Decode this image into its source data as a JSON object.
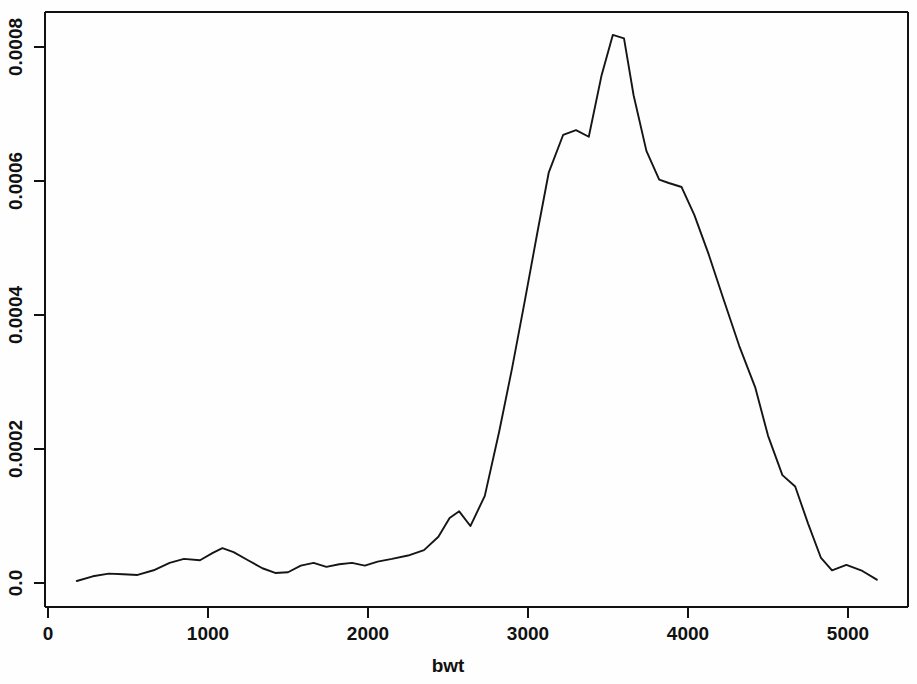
{
  "chart_data": {
    "type": "line",
    "title": "",
    "subtitle": "",
    "xlabel": "bwt",
    "ylabel": "",
    "xlim": [
      150,
      5220
    ],
    "ylim": [
      0.0,
      0.00085
    ],
    "grid": false,
    "legend": null,
    "line_color": "#151515",
    "background_color": "#ffffff",
    "axis_color": "#111111",
    "x_ticks": [
      0,
      1000,
      2000,
      3000,
      4000,
      5000
    ],
    "x_tick_labels": [
      "0",
      "1000",
      "2000",
      "3000",
      "4000",
      "5000"
    ],
    "y_ticks": [
      0.0,
      0.0002,
      0.0004,
      0.0006,
      0.0008
    ],
    "y_tick_labels": [
      "0.0",
      "0.0002",
      "0.0004",
      "0.0006",
      "0.0008"
    ],
    "x": [
      180,
      280,
      380,
      470,
      560,
      660,
      760,
      850,
      950,
      1030,
      1090,
      1160,
      1250,
      1340,
      1420,
      1500,
      1580,
      1660,
      1740,
      1820,
      1900,
      1980,
      2060,
      2150,
      2250,
      2350,
      2440,
      2510,
      2570,
      2640,
      2730,
      2820,
      2900,
      2980,
      3060,
      3130,
      3220,
      3300,
      3380,
      3460,
      3530,
      3600,
      3660,
      3740,
      3820,
      3880,
      3960,
      4040,
      4130,
      4220,
      4320,
      4420,
      4500,
      4590,
      4670,
      4750,
      4830,
      4900,
      4990,
      5090,
      5180
    ],
    "y": [
      3e-06,
      1e-05,
      1.4e-05,
      1.3e-05,
      1.2e-05,
      1.9e-05,
      3e-05,
      3.6e-05,
      3.4e-05,
      4.5e-05,
      5.2e-05,
      4.6e-05,
      3.4e-05,
      2.2e-05,
      1.5e-05,
      1.6e-05,
      2.6e-05,
      3e-05,
      2.4e-05,
      2.8e-05,
      3e-05,
      2.6e-05,
      3.2e-05,
      3.6e-05,
      4.1e-05,
      4.9e-05,
      6.9e-05,
      9.7e-05,
      0.000107,
      8.5e-05,
      0.00013,
      0.000226,
      0.00032,
      0.000421,
      0.000525,
      0.000613,
      0.000669,
      0.000676,
      0.000666,
      0.000758,
      0.000818,
      0.000813,
      0.000728,
      0.000645,
      0.000602,
      0.000597,
      0.000591,
      0.000549,
      0.00049,
      0.000425,
      0.000354,
      0.000292,
      0.00022,
      0.000161,
      0.000144,
      8.9e-05,
      3.8e-05,
      1.9e-05,
      2.7e-05,
      1.8e-05,
      5e-06
    ]
  },
  "axes": {
    "x_axis_name": "bwt-axis",
    "y_axis_name": "density-axis"
  }
}
